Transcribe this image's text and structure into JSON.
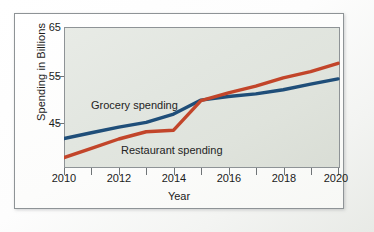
{
  "chart_data": {
    "type": "line",
    "title": "",
    "xlabel": "Year",
    "ylabel": "Spending in Billions",
    "xlim": [
      2010,
      2020
    ],
    "ylim": [
      38,
      65
    ],
    "xticks": [
      2010,
      2012,
      2014,
      2016,
      2018,
      2020
    ],
    "xtick_labels": [
      "2010",
      "2012",
      "2014",
      "2016",
      "2018",
      "2020"
    ],
    "xminor_ticks": [
      2011,
      2013,
      2015,
      2017,
      2019
    ],
    "yticks": [
      45,
      55,
      65
    ],
    "ytick_labels": [
      "45",
      "55",
      "65"
    ],
    "grid": false,
    "legend": "inline-labels",
    "x": [
      2010,
      2011,
      2012,
      2013,
      2014,
      2015,
      2016,
      2017,
      2018,
      2019,
      2020
    ],
    "series": [
      {
        "name": "Grocery spending",
        "color": "#1F4E79",
        "label_text": "Grocery spending",
        "values": [
          43.5,
          44.6,
          45.7,
          46.6,
          48.2,
          50.9,
          51.6,
          52.1,
          52.9,
          54.0,
          55.0
        ]
      },
      {
        "name": "Restaurant spending",
        "color": "#C2452A",
        "label_text": "Restaurant spending",
        "values": [
          39.8,
          41.6,
          43.4,
          44.8,
          45.1,
          50.8,
          52.3,
          53.6,
          55.2,
          56.4,
          58.0
        ]
      }
    ]
  },
  "figure": {
    "border_color": "#8e9396",
    "plot_background": "#e4e8e1"
  }
}
